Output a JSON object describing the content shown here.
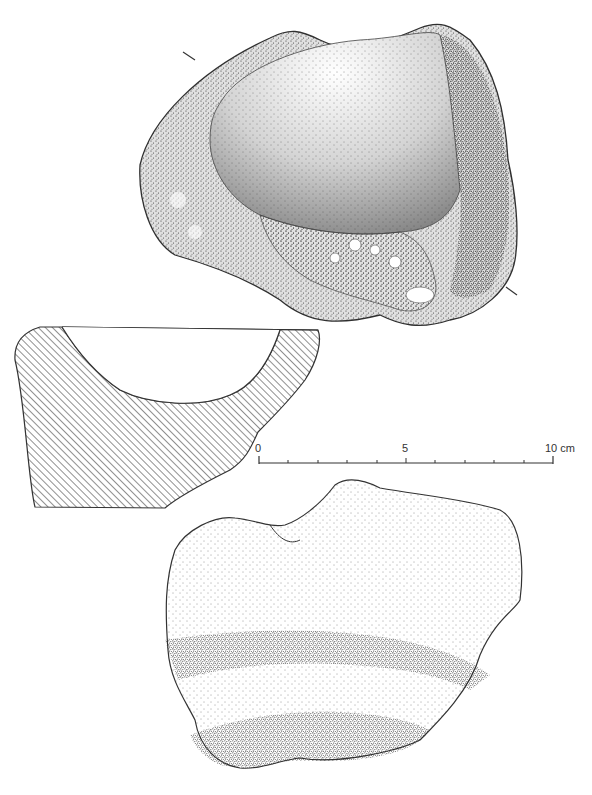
{
  "figure": {
    "type": "archaeological artifact drawing",
    "views": [
      {
        "id": "top-view",
        "description": "stippled plan view of stone mortar fragment with hollow basin"
      },
      {
        "id": "section",
        "description": "hatched cross-section profile showing curved basin"
      },
      {
        "id": "side-view",
        "description": "stippled exterior view with two shaded horizontal bands"
      }
    ],
    "colors": {
      "ink": "#2a2a2a",
      "paper": "#ffffff"
    }
  },
  "scale_bar": {
    "labels": [
      "0",
      "5",
      "10 cm"
    ],
    "unit": "cm",
    "min": 0,
    "max": 10,
    "ticks": 11
  }
}
